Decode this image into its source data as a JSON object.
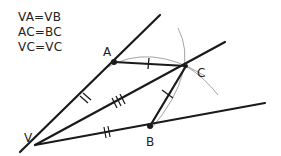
{
  "equations": [
    "VA=VB",
    "AC=BC",
    "VC=VC"
  ],
  "points": {
    "V": {
      "label": "V",
      "x": 35,
      "y": 145,
      "label_x": 24,
      "label_y": 142
    },
    "A": {
      "label": "A",
      "x": 114,
      "y": 62,
      "label_x": 103,
      "label_y": 56
    },
    "C": {
      "label": "C",
      "x": 186,
      "y": 66,
      "label_x": 197,
      "label_y": 77
    },
    "B": {
      "label": "B",
      "x": 150,
      "y": 126,
      "label_x": 146,
      "label_y": 146
    }
  },
  "colors": {
    "line": "#1a1a1a",
    "arc": "#9a9a9a",
    "text": "#222222",
    "background": "#ffffff"
  }
}
